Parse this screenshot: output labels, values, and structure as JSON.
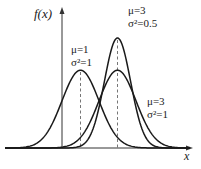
{
  "chart_data": {
    "type": "line",
    "title": "",
    "xlabel": "x",
    "ylabel": "f(x)",
    "grid": false,
    "legend": "inline annotations",
    "xlim": [
      -3.3,
      7.0
    ],
    "ylim": [
      0,
      0.72
    ],
    "series": [
      {
        "name": "μ=1, σ²=1",
        "mu": 1,
        "variance": 1,
        "peak": 0.399,
        "label_lines": [
          "μ=1",
          "σ²=1"
        ]
      },
      {
        "name": "μ=3, σ²=0.5",
        "mu": 3,
        "variance": 0.5,
        "peak": 0.564,
        "label_lines": [
          "μ=3",
          "σ²=0.5"
        ]
      },
      {
        "name": "μ=3, σ²=1",
        "mu": 3,
        "variance": 1,
        "peak": 0.399,
        "label_lines": [
          "μ=3",
          "σ²=1"
        ]
      }
    ],
    "annotations": [
      "dashed vertical line at x=μ=1",
      "dashed vertical line at x=μ=3"
    ]
  },
  "axes": {
    "y_label": "f(x)",
    "x_label": "x"
  },
  "labels": {
    "c1_mu": "μ=1",
    "c1_var": "σ²=1",
    "c2_mu": "μ=3",
    "c2_var": "σ²=0.5",
    "c3_mu": "μ=3",
    "c3_var": "σ²=1"
  },
  "colors": {
    "curve": "#1a1a1a",
    "axis": "#333333",
    "dashed": "#666666"
  }
}
